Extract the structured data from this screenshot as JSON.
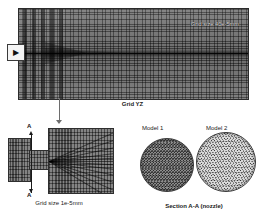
{
  "figure": {
    "type": "cfd-mesh-figure",
    "background": "#ffffff"
  },
  "main_panel": {
    "name": "grid-yz",
    "caption": "Grid YZ",
    "grid_size_label": "Grid size 40e-5mm",
    "inlet_marker_icon": "right-arrow-icon",
    "mesh_color": "#5a5a5a",
    "border_color": "#2b2b2b"
  },
  "detail_panel": {
    "name": "nozzle-detail",
    "caption": "Grid size 1e-5mm",
    "section_label_top": "A",
    "section_label_bottom": "A",
    "mesh_color": "#636363"
  },
  "section_panel": {
    "caption": "Section A-A (nozzle)",
    "models": [
      {
        "label": "Model 1",
        "mesh_color": "#6b6b6b"
      },
      {
        "label": "Model 2",
        "mesh_color": "#9b9b9b"
      }
    ]
  }
}
